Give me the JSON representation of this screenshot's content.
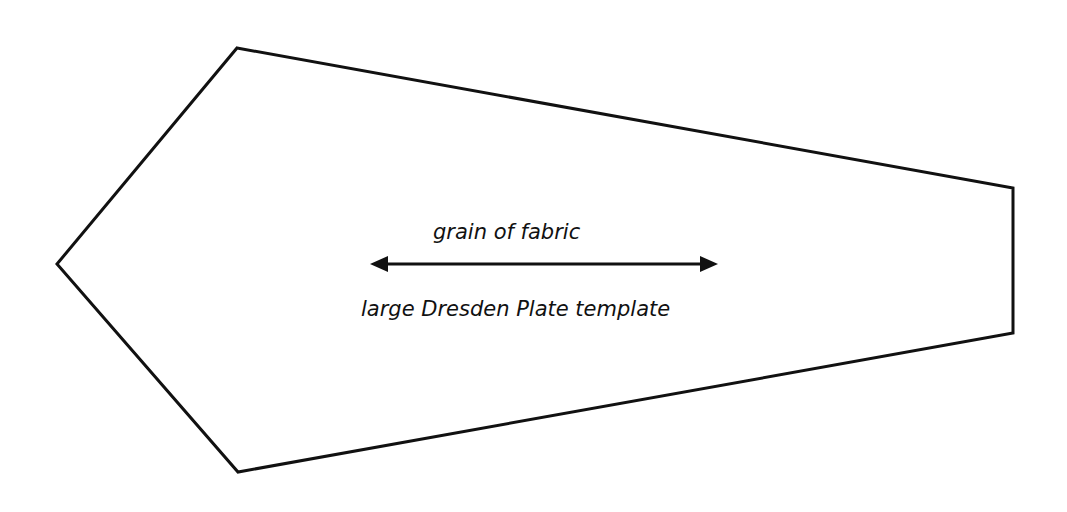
{
  "diagram": {
    "shape": {
      "type": "polygon",
      "stroke": "#111111",
      "points": [
        [
          237,
          48
        ],
        [
          1013,
          188
        ],
        [
          1013,
          333
        ],
        [
          238,
          472
        ],
        [
          57,
          264
        ]
      ]
    },
    "arrow": {
      "type": "double-headed",
      "from": [
        370,
        264
      ],
      "to": [
        718,
        264
      ],
      "color": "#111111"
    },
    "labels": {
      "grain": "grain of fabric",
      "template": "large Dresden Plate template"
    }
  }
}
